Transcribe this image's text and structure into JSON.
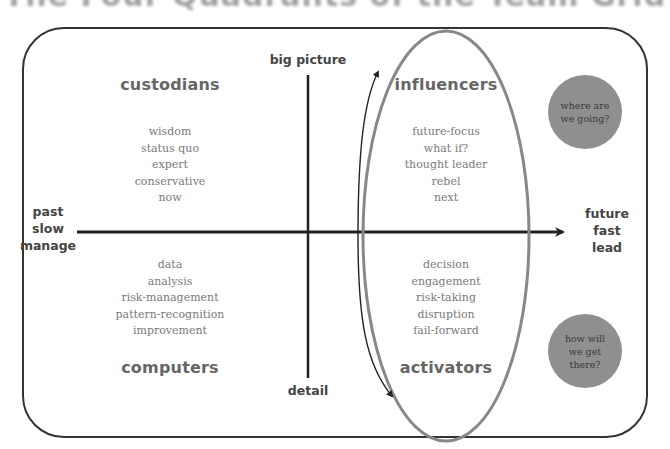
{
  "title": "The Four Quadrants of the Team Grid",
  "axes": {
    "vertical_top": "big picture",
    "vertical_bottom": "detail",
    "horizontal_left": [
      "past",
      "slow",
      "manage"
    ],
    "horizontal_right": [
      "future",
      "fast",
      "lead"
    ]
  },
  "quadrants": {
    "top_left": {
      "heading": "custodians",
      "items": [
        "wisdom",
        "status quo",
        "expert",
        "conservative",
        "now"
      ]
    },
    "bottom_left": {
      "heading": "computers",
      "items": [
        "data",
        "analysis",
        "risk-management",
        "pattern-recognition",
        "improvement"
      ]
    },
    "top_right": {
      "heading": "influencers",
      "items": [
        "future-focus",
        "what if?",
        "thought leader",
        "rebel",
        "next"
      ]
    },
    "bottom_right": {
      "heading": "activators",
      "items": [
        "decision",
        "engagement",
        "risk-taking",
        "disruption",
        "fail-forward"
      ]
    }
  },
  "bubbles": {
    "top": "where are\nwe going?",
    "bottom": "how will\nwe get\nthere?"
  },
  "colors": {
    "frame": "#333333",
    "axis_line": "#222222",
    "ellipse": "#888888",
    "heading_text": "#666666",
    "list_text": "#7a7a7a",
    "bubble_fill": "#8f8f8f"
  }
}
